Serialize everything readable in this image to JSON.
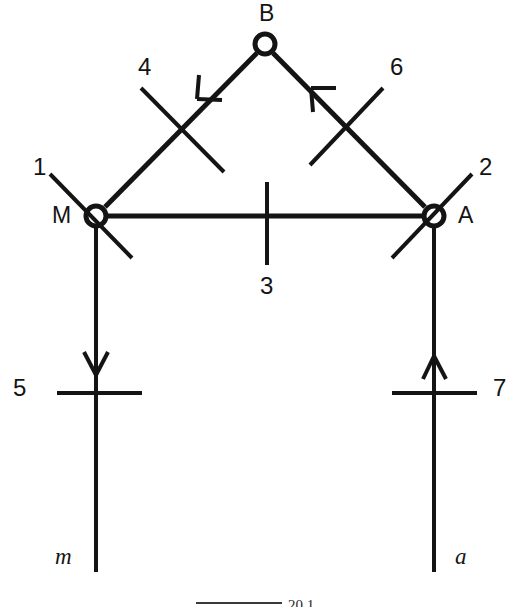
{
  "figure": {
    "type": "kinematic-linkage-diagram",
    "background_color": "#ffffff",
    "stroke_color": "#141414",
    "nodes": [
      {
        "id": "B",
        "label": "B",
        "x": 265,
        "y": 44
      },
      {
        "id": "M",
        "label": "M",
        "x": 96,
        "y": 216
      },
      {
        "id": "A",
        "label": "A",
        "x": 434,
        "y": 216
      }
    ],
    "node_labels": {
      "B": "B",
      "M": "M",
      "A": "A"
    },
    "link_numbers": {
      "one": "1",
      "two": "2",
      "three": "3",
      "four": "4",
      "five": "5",
      "six": "6",
      "seven": "7"
    },
    "variable_labels": {
      "left": "m",
      "right": "a"
    },
    "caption": {
      "text": "20.1",
      "visible": "partial"
    },
    "arrows": [
      {
        "on": "4",
        "direction": "down-left",
        "along": "B-to-M"
      },
      {
        "on": "6",
        "direction": "up-left",
        "along": "A-to-B"
      },
      {
        "on": "5",
        "direction": "down",
        "along": "M-vertical"
      },
      {
        "on": "7",
        "direction": "up",
        "along": "A-vertical"
      }
    ]
  }
}
